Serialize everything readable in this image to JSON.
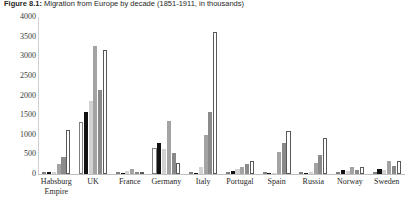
{
  "figure": {
    "label": "Figure 8.1:",
    "caption": "Migration from Europe by decade (1851-1911, in thousands)",
    "full_title": "Figure 8.1: Migration from Europe by decade (1851-1911, in thousands)"
  },
  "axes": {
    "y_ticks": [
      "4000",
      "3500",
      "3000",
      "2500",
      "2000",
      "1500",
      "1000",
      "500",
      "0"
    ],
    "y_min": 0,
    "y_max": 4000,
    "y_step": 500,
    "x_label": "",
    "y_label": ""
  },
  "colors": {
    "series_1": "#ffffff",
    "series_2": "#111111",
    "series_3": "#d2d2d2",
    "series_4": "#a3a3a3",
    "series_5": "#8a8a8a",
    "series_6": "#ffffff",
    "axis": "#bfbfbf",
    "text": "#1f1f1f"
  },
  "chart_data": {
    "type": "bar",
    "title": "Figure 8.1: Migration from Europe by decade (1851-1911, in thousands)",
    "xlabel": "",
    "ylabel": "",
    "ylim": [
      0,
      4000
    ],
    "grid": false,
    "legend": "none",
    "categories": [
      "Habsburg Empire",
      "UK",
      "France",
      "Germany",
      "Italy",
      "Portugal",
      "Spain",
      "Russia",
      "Norway",
      "Sweden"
    ],
    "series": [
      {
        "name": "1851-1860",
        "values": [
          31,
          1313,
          27,
          671,
          5,
          45,
          3,
          0,
          36,
          17
        ]
      },
      {
        "name": "1861-1870",
        "values": [
          40,
          1572,
          36,
          779,
          27,
          79,
          7,
          0,
          98,
          122
        ]
      },
      {
        "name": "1871-1880",
        "values": [
          46,
          1849,
          66,
          626,
          168,
          131,
          13,
          58,
          85,
          103
        ]
      },
      {
        "name": "1881-1890",
        "values": [
          248,
          3259,
          119,
          1342,
          992,
          185,
          572,
          288,
          187,
          327
        ]
      },
      {
        "name": "1891-1900",
        "values": [
          440,
          2149,
          51,
          527,
          1580,
          266,
          791,
          481,
          95,
          205
        ]
      },
      {
        "name": "1901-1910",
        "values": [
          1111,
          3150,
          53,
          274,
          3615,
          324,
          1091,
          911,
          191,
          324
        ]
      }
    ]
  }
}
